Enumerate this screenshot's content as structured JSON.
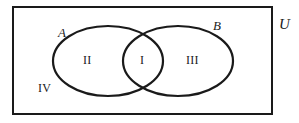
{
  "figure": {
    "type": "venn-diagram-two-sets",
    "stroke_color": "#1a1a1a",
    "background_color": "#ffffff",
    "universe": {
      "label": "U",
      "shape": "rectangle",
      "x": 13,
      "y": 7,
      "width": 259,
      "height": 107,
      "stroke_width": 2
    },
    "sets": [
      {
        "name": "A",
        "label": "A",
        "shape": "ellipse",
        "cx": 108,
        "cy": 61,
        "rx": 55,
        "ry": 35,
        "stroke_width": 2.2
      },
      {
        "name": "B",
        "label": "B",
        "shape": "ellipse",
        "cx": 178,
        "cy": 61,
        "rx": 55,
        "ry": 35,
        "stroke_width": 2.2
      }
    ],
    "regions": [
      {
        "label": "I",
        "meaning": "A intersect B"
      },
      {
        "label": "II",
        "meaning": "A only"
      },
      {
        "label": "III",
        "meaning": "B only"
      },
      {
        "label": "IV",
        "meaning": "outside A and B"
      }
    ]
  }
}
